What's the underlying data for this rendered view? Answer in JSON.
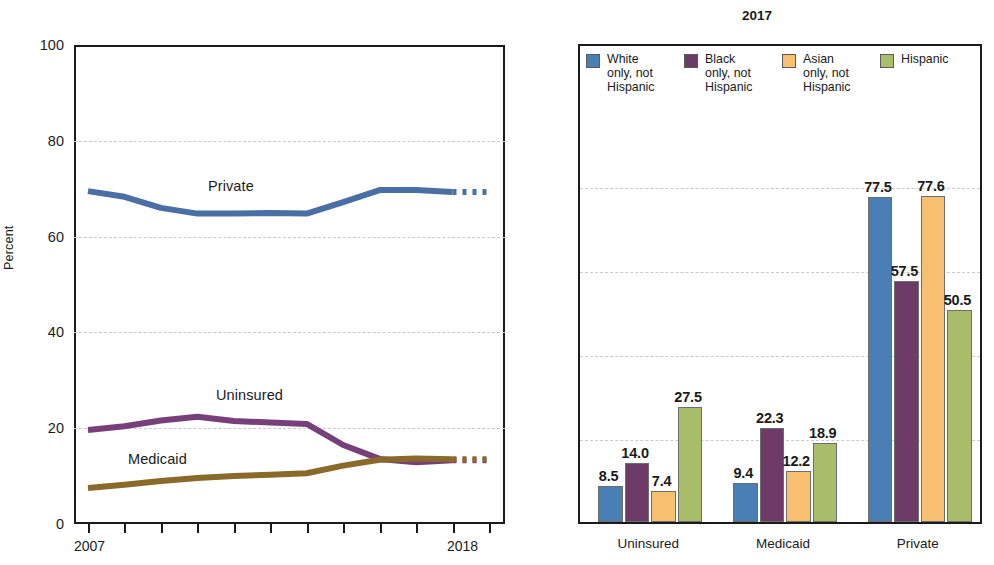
{
  "left_chart": {
    "ylabel": "Percent",
    "y_ticks": [
      "0",
      "20",
      "40",
      "60",
      "80",
      "100"
    ],
    "x_start_label": "2007",
    "x_end_label": "2018",
    "series_labels": {
      "private": "Private",
      "uninsured": "Uninsured",
      "medicaid": "Medicaid"
    }
  },
  "right_chart": {
    "title": "2017",
    "legend": [
      {
        "label": "White\nonly, not\nHispanic",
        "color": "#4a7fb5"
      },
      {
        "label": "Black\nonly, not\nHispanic",
        "color": "#6e3b68"
      },
      {
        "label": "Asian\nonly, not\nHispanic",
        "color": "#f6c070"
      },
      {
        "label": "Hispanic",
        "color": "#a9bd6b"
      }
    ],
    "group_labels": [
      "Uninsured",
      "Medicaid",
      "Private"
    ]
  },
  "chart_data": [
    {
      "type": "line",
      "title": "",
      "xlabel": "",
      "ylabel": "Percent",
      "xlim": [
        2007,
        2018
      ],
      "ylim": [
        0,
        100
      ],
      "yticks": [
        0,
        20,
        40,
        60,
        80,
        100
      ],
      "xticks": [
        2007,
        2008,
        2009,
        2010,
        2011,
        2012,
        2013,
        2014,
        2015,
        2016,
        2017,
        2018
      ],
      "grid": true,
      "legend": "inline-annotations",
      "x": [
        2007,
        2008,
        2009,
        2010,
        2011,
        2012,
        2013,
        2014,
        2015,
        2016,
        2017,
        2018
      ],
      "series": [
        {
          "name": "Private",
          "color": "#4a6fa5",
          "values": [
            69.5,
            68.3,
            66.0,
            64.8,
            64.8,
            64.9,
            64.8,
            67.2,
            69.7,
            69.7,
            69.3,
            69.3
          ],
          "dashed_from": 2017
        },
        {
          "name": "Uninsured",
          "color": "#77407a",
          "values": [
            19.6,
            20.4,
            21.6,
            22.4,
            21.5,
            21.2,
            20.9,
            16.5,
            13.6,
            12.9,
            13.3,
            13.3
          ],
          "dashed_from": 2017
        },
        {
          "name": "Medicaid",
          "color": "#8a6a2a",
          "values": [
            7.5,
            8.2,
            9.0,
            9.6,
            10.0,
            10.3,
            10.6,
            12.2,
            13.4,
            13.7,
            13.5,
            13.5
          ],
          "dashed_from": 2017
        }
      ]
    },
    {
      "type": "bar",
      "title": "2017",
      "xlabel": "",
      "ylabel": "",
      "ylim": [
        0,
        100
      ],
      "grid": true,
      "gridlines": [
        20,
        40,
        60,
        80
      ],
      "categories": [
        "Uninsured",
        "Medicaid",
        "Private"
      ],
      "legend_position": "top",
      "series": [
        {
          "name": "White only, not Hispanic",
          "color": "#4a7fb5",
          "values": [
            8.5,
            9.4,
            77.5
          ]
        },
        {
          "name": "Black only, not Hispanic",
          "color": "#6e3b68",
          "values": [
            14.0,
            22.3,
            57.5
          ]
        },
        {
          "name": "Asian only, not Hispanic",
          "color": "#f6c070",
          "values": [
            7.4,
            12.2,
            77.6
          ]
        },
        {
          "name": "Hispanic",
          "color": "#a9bd6b",
          "values": [
            27.5,
            18.9,
            50.5
          ]
        }
      ],
      "data_labels": [
        [
          "8.5",
          "14.0",
          "7.4",
          "27.5"
        ],
        [
          "9.4",
          "22.3",
          "12.2",
          "18.9"
        ],
        [
          "77.5",
          "57.5",
          "77.6",
          "50.5"
        ]
      ]
    }
  ]
}
